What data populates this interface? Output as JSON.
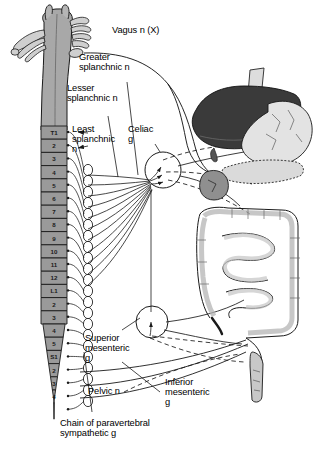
{
  "figure": {
    "background_color": "#ffffff",
    "ink_color": "#1a1a1a"
  },
  "labels": {
    "vagus": "Vagus n (X)",
    "greater_splanchnic": "Greater\nsplanchnic n",
    "lesser_splanchnic": "Lesser\nsplanchnic n",
    "least_splanchnic": "Least\nsplanchnic\nn",
    "celiac": "Celiac\ng",
    "superior_mesenteric": "Superior\nmesenteric\ng",
    "inferior_mesenteric": "Inferior\nmesenteric\ng",
    "pelvic": "Pelvic n",
    "chain": "Chain of paravertebral\nsympathetic g"
  },
  "spinal_cord": {
    "segments": [
      "T1",
      "2",
      "3",
      "4",
      "5",
      "6",
      "7",
      "8",
      "9",
      "10",
      "11",
      "12",
      "L1",
      "2",
      "3",
      "4",
      "5",
      "S1",
      "2",
      "3",
      "4"
    ],
    "segment_fill": "#9a9a9a",
    "cord_fill": "#a8a8a8"
  },
  "organs": {
    "liver": {
      "name": "liver",
      "fill": "#3a3a3a"
    },
    "stomach": {
      "name": "stomach",
      "fill": "#e0e0e0"
    },
    "esophagus": {
      "name": "esophagus",
      "fill": "#dcdcdc"
    },
    "pancreas": {
      "name": "pancreas",
      "fill": "#d8d8d8"
    },
    "duodenum": {
      "name": "duodenum",
      "fill": "#8f8f8f"
    },
    "colon": {
      "name": "colon",
      "fill": "#d5d5d5"
    },
    "small_intestine": {
      "name": "small-intestine",
      "fill": "#cfcfcf"
    },
    "rectum": {
      "name": "rectum",
      "fill": "#c8c8c8"
    }
  },
  "ganglia": {
    "celiac_marker": "circle-with-arrowheads",
    "superior_mesenteric_marker": "circle-with-arrowhead"
  }
}
